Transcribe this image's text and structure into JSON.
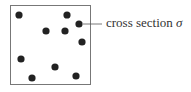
{
  "diagram": {
    "box": {
      "x": 10,
      "y": 5,
      "width": 80,
      "height": 79
    },
    "dots": [
      {
        "x": 19,
        "y": 15
      },
      {
        "x": 67,
        "y": 15
      },
      {
        "x": 79,
        "y": 24
      },
      {
        "x": 46,
        "y": 31
      },
      {
        "x": 65,
        "y": 31
      },
      {
        "x": 82,
        "y": 42
      },
      {
        "x": 21,
        "y": 59
      },
      {
        "x": 55,
        "y": 67
      },
      {
        "x": 76,
        "y": 76
      },
      {
        "x": 32,
        "y": 78
      }
    ],
    "dot_color": "#222222",
    "label": {
      "text": "cross section ",
      "symbol": "σ"
    }
  }
}
